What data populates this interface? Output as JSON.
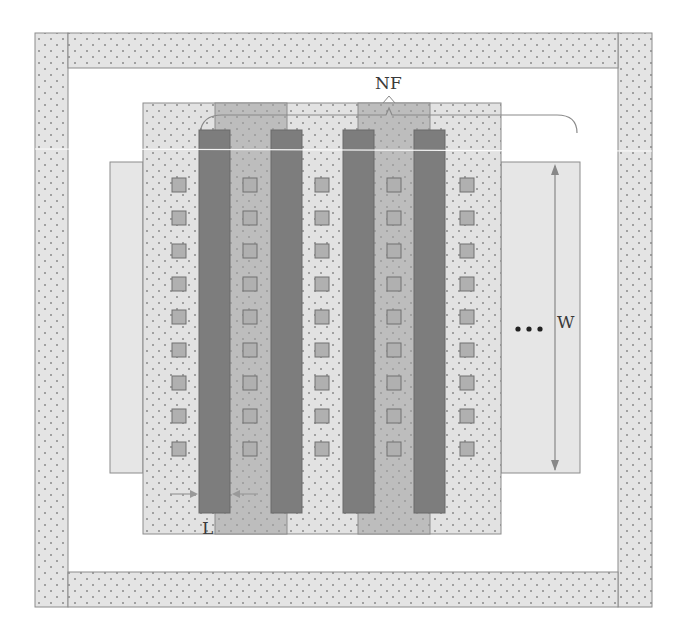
{
  "diagram": {
    "type": "multi-finger MOSFET layout",
    "labels": {
      "nf": "NF",
      "w": "W",
      "l": "L",
      "ellipsis": "•••"
    },
    "colors": {
      "background": "#ffffff",
      "guard_ring_fill": "#e4e4e4",
      "dot": "#8a8a8a",
      "outline": "#8c8c8c",
      "active_fill": "#e2e2e2",
      "diffusion_strip_fill": "#bdbdbd",
      "gate_fill": "#7d7d7d",
      "contact_fill": "#b0b0b0",
      "contact_stroke": "#707070",
      "side_box_fill": "#e6e6e6",
      "dimension_line": "#888888"
    },
    "guard_ring": {
      "outer": {
        "x": 35,
        "y": 33,
        "w": 617,
        "h": 574
      },
      "thickness": 34
    },
    "active_region": {
      "x": 143,
      "y": 103,
      "w": 358,
      "h": 431
    },
    "side_boxes": [
      {
        "name": "left",
        "x": 110,
        "y": 162,
        "w": 33,
        "h": 311
      },
      {
        "name": "right",
        "x": 501,
        "y": 162,
        "w": 79,
        "h": 311
      }
    ],
    "diffusion_strips": [
      {
        "x": 215,
        "y": 103,
        "w": 72,
        "h": 431
      },
      {
        "x": 358,
        "y": 103,
        "w": 72,
        "h": 431
      }
    ],
    "gates": [
      {
        "x": 199,
        "y": 130,
        "w": 31,
        "h": 383
      },
      {
        "x": 271,
        "y": 130,
        "w": 31,
        "h": 383
      },
      {
        "x": 343,
        "y": 130,
        "w": 31,
        "h": 383
      },
      {
        "x": 414,
        "y": 130,
        "w": 31,
        "h": 383
      }
    ],
    "contacts": {
      "size": 14,
      "columns_x": [
        172,
        243,
        315,
        387,
        460
      ],
      "rows_y": [
        178,
        211,
        244,
        277,
        310,
        343,
        376,
        409,
        442
      ]
    },
    "nf_brace": {
      "start_x": 200,
      "peak_x": 389,
      "end_x": 577,
      "y": 115
    },
    "w_dimension": {
      "x": 555,
      "y1": 164,
      "y2": 471
    },
    "l_dimension": {
      "y": 494,
      "left_arrow_end": 198,
      "right_arrow_end": 231
    }
  }
}
